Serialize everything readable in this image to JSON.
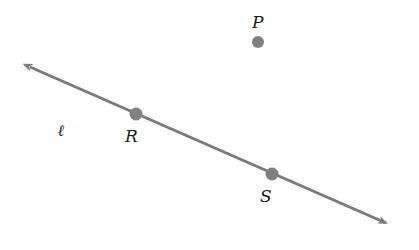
{
  "diagram": {
    "colors": {
      "line": "#7a7a7a",
      "point": "#808080",
      "label": "#1a1a1a",
      "background": "#ffffff"
    },
    "line": {
      "name": "ℓ",
      "start": [
        24,
        64
      ],
      "end": [
        392,
        226
      ]
    },
    "points": [
      {
        "name": "P",
        "x": 258,
        "y": 42,
        "label_x": 252,
        "label_y": 28
      },
      {
        "name": "R",
        "x": 136,
        "y": 114,
        "label_x": 125,
        "label_y": 142
      },
      {
        "name": "S",
        "x": 272,
        "y": 174,
        "label_x": 260,
        "label_y": 202
      }
    ],
    "line_label": {
      "text": "ℓ",
      "x": 58,
      "y": 136
    }
  }
}
